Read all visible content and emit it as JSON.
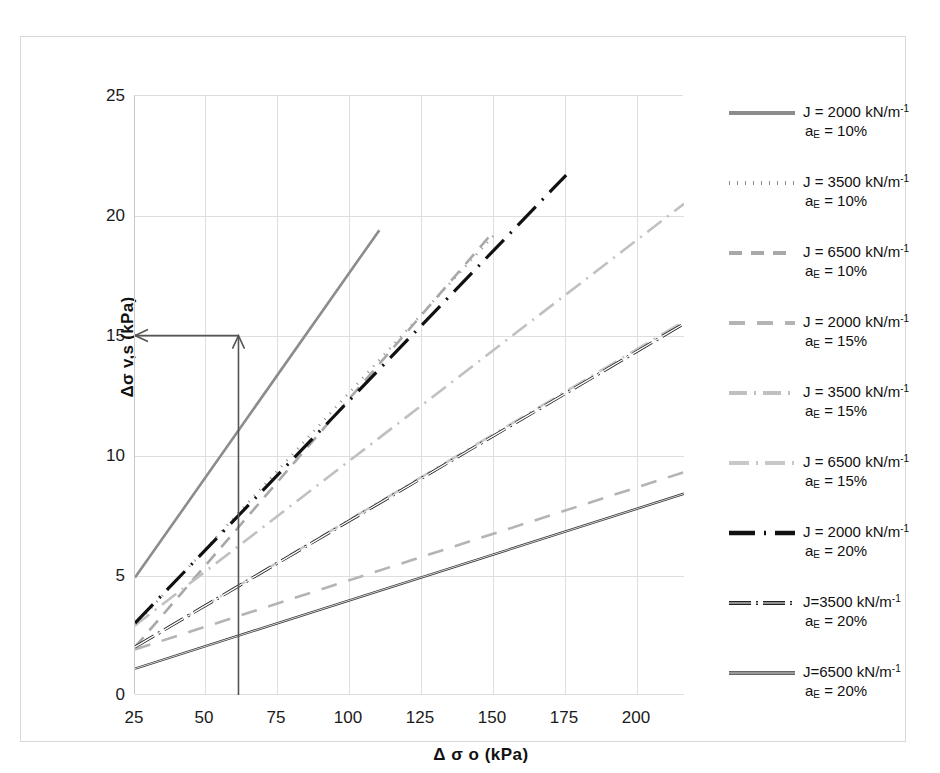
{
  "chart_data": {
    "type": "line",
    "title": "",
    "xlabel": "Δ σ o (kPa)",
    "ylabel": "Δσ v,s (kPa)",
    "xlim": [
      25,
      216
    ],
    "ylim": [
      0,
      25
    ],
    "x_ticks": [
      25,
      50,
      75,
      100,
      125,
      150,
      175,
      200
    ],
    "y_ticks": [
      0,
      5,
      10,
      15,
      20,
      25
    ],
    "grid": true,
    "legend_position": "right",
    "series": [
      {
        "name": "J = 2000 kN/m⁻¹, a_E = 10%",
        "style": "solid",
        "color": "#8c8c8c",
        "width": 2.6,
        "points": [
          [
            25,
            4.9
          ],
          [
            110,
            19.4
          ]
        ]
      },
      {
        "name": "J = 3500 kN/m⁻¹, a_E = 10%",
        "style": "dotted",
        "color": "#8c8c8c",
        "width": 2.6,
        "points": [
          [
            25,
            2.9
          ],
          [
            150,
            19.2
          ]
        ]
      },
      {
        "name": "J = 6500 kN/m⁻¹, a_E = 10%",
        "style": "dashed",
        "color": "#a8a8a8",
        "width": 2.6,
        "points": [
          [
            25,
            2.0
          ],
          [
            148,
            19.1
          ]
        ]
      },
      {
        "name": "J = 2000 kN/m⁻¹, a_E = 15%",
        "style": "long-dash",
        "color": "#b4b4b4",
        "width": 2.6,
        "points": [
          [
            25,
            1.9
          ],
          [
            216,
            9.3
          ]
        ]
      },
      {
        "name": "J = 3500 kN/m⁻¹, a_E = 15%",
        "style": "dash-dot",
        "color": "#c0c0c0",
        "width": 2.6,
        "points": [
          [
            25,
            2.9
          ],
          [
            216,
            20.5
          ]
        ]
      },
      {
        "name": "J = 6500 kN/m⁻¹, a_E = 15%",
        "style": "dash-dot-light",
        "color": "#c8c8c8",
        "width": 2.6,
        "points": [
          [
            25,
            2.0
          ],
          [
            216,
            15.6
          ]
        ]
      },
      {
        "name": "J = 2000 kN/m⁻¹, a_E = 20%",
        "style": "dash-dot-heavy",
        "color": "#111111",
        "width": 3.2,
        "points": [
          [
            25,
            3.0
          ],
          [
            175,
            21.7
          ]
        ]
      },
      {
        "name": "J=3500 kN/m⁻¹, a_E = 20%",
        "style": "dash-dot-dark",
        "color": "#222222",
        "width": 3.0,
        "points": [
          [
            25,
            2.0
          ],
          [
            216,
            15.5
          ]
        ]
      },
      {
        "name": "J=6500 kN/m⁻¹, a_E = 20%",
        "style": "solid-dark",
        "color": "#333333",
        "width": 2.4,
        "points": [
          [
            25,
            1.1
          ],
          [
            216,
            8.4
          ]
        ]
      }
    ],
    "annotations": [
      {
        "type": "arrow",
        "label": "vertical-guide",
        "from": [
          61,
          0
        ],
        "to": [
          61,
          15
        ]
      },
      {
        "type": "arrow",
        "label": "horizontal-guide",
        "from": [
          61,
          15
        ],
        "to": [
          25,
          15
        ]
      }
    ]
  },
  "axes": {
    "x": {
      "title": "Δ σ o (kPa)",
      "ticks": [
        "25",
        "50",
        "75",
        "100",
        "125",
        "150",
        "175",
        "200"
      ]
    },
    "y": {
      "title": "Δσ v,s  (kPa)",
      "ticks": [
        "25",
        "20",
        "15",
        "10",
        "5",
        "0"
      ]
    }
  },
  "legend": {
    "items": [
      {
        "line1": "J = 2000 kN/m",
        "exp": "-1",
        "line2_pre": "a",
        "line2_sub": "E",
        "line2_post": " = 10%",
        "swatch": "solid-gray"
      },
      {
        "line1": "J = 3500 kN/m",
        "exp": "-1",
        "line2_pre": "a",
        "line2_sub": "E",
        "line2_post": " = 10%",
        "swatch": "dotted-gray"
      },
      {
        "line1": "J = 6500 kN/m",
        "exp": "-1",
        "line2_pre": "a",
        "line2_sub": "E",
        "line2_post": " = 10%",
        "swatch": "dashed-gray"
      },
      {
        "line1": "J = 2000 kN/m",
        "exp": "-1",
        "line2_pre": "a",
        "line2_sub": "E",
        "line2_post": " = 15%",
        "swatch": "longdash-gray"
      },
      {
        "line1": "J = 3500 kN/m",
        "exp": "-1",
        "line2_pre": "a",
        "line2_sub": "E",
        "line2_post": " = 15%",
        "swatch": "dashdot-gray"
      },
      {
        "line1": "J = 6500 kN/m",
        "exp": "-1",
        "line2_pre": "a",
        "line2_sub": "E",
        "line2_post": " = 15%",
        "swatch": "dashdotlight-gray"
      },
      {
        "line1": "J = 2000 kN/m",
        "exp": "-1",
        "line2_pre": "a",
        "line2_sub": "E",
        "line2_post": " = 20%",
        "swatch": "dashdot-black"
      },
      {
        "line1": "J=3500 kN/m",
        "exp": "-1",
        "line2_pre": "a",
        "line2_sub": "E",
        "line2_post": " = 20%",
        "swatch": "dashdot-dark"
      },
      {
        "line1": "J=6500 kN/m",
        "exp": "-1",
        "line2_pre": "a",
        "line2_sub": "E",
        "line2_post": " = 20%",
        "swatch": "solid-dark"
      }
    ]
  },
  "colors": {
    "grid": "#dedede",
    "frame": "#d8d8d8",
    "text": "#111111",
    "annotation": "#555555"
  }
}
